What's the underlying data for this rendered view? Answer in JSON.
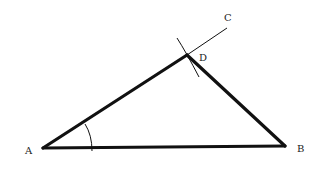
{
  "diagram": {
    "type": "geometric-construction",
    "colors": {
      "background": "#ffffff",
      "stroke": "#111111",
      "label": "#222222"
    },
    "points": {
      "A": {
        "label": "A",
        "x": 43,
        "y": 148
      },
      "B": {
        "label": "B",
        "x": 285,
        "y": 146
      },
      "C": {
        "label": "C",
        "x": 227,
        "y": 28
      },
      "D": {
        "label": "D",
        "x": 187,
        "y": 55
      }
    },
    "segments": [
      {
        "from": "A",
        "to": "B",
        "weight": "thick"
      },
      {
        "from": "A",
        "to": "D",
        "weight": "thick"
      },
      {
        "from": "D",
        "to": "B",
        "weight": "thick"
      },
      {
        "from": "D",
        "to": "C",
        "weight": "thin"
      }
    ],
    "arcs": [
      {
        "name": "angle-arc-A",
        "center": "A",
        "radius": 49
      },
      {
        "name": "construction-arc-D",
        "center": "A",
        "radius": 160
      }
    ]
  }
}
